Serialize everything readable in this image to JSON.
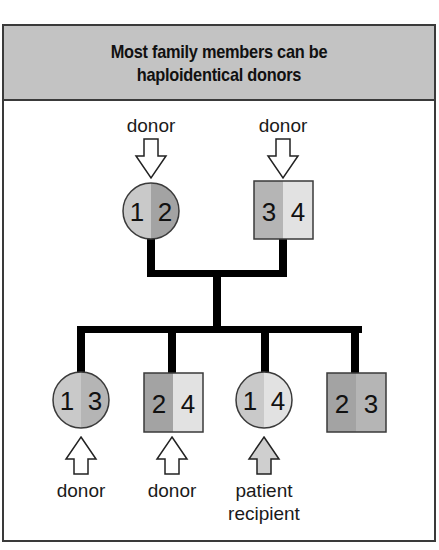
{
  "title": "Most family members can be haploidentical donors",
  "title_lines": [
    "Most family members can be",
    "haploidentical donors"
  ],
  "colors": {
    "haplotype_1": "#c9c9c9",
    "haplotype_2": "#a3a3a3",
    "haplotype_3": "#b5b5b5",
    "haplotype_4": "#e2e2e2",
    "header_bg": "#c3c3c3",
    "line": "#000000",
    "recipient_arrow": "#cfcfcf"
  },
  "parents": [
    {
      "shape": "circle",
      "sex": "female",
      "haplotypes": [
        "1",
        "2"
      ],
      "label": "donor"
    },
    {
      "shape": "square",
      "sex": "male",
      "haplotypes": [
        "3",
        "4"
      ],
      "label": "donor"
    }
  ],
  "children": [
    {
      "shape": "circle",
      "sex": "female",
      "haplotypes": [
        "1",
        "3"
      ],
      "label": "donor"
    },
    {
      "shape": "square",
      "sex": "male",
      "haplotypes": [
        "2",
        "4"
      ],
      "label": "donor"
    },
    {
      "shape": "circle",
      "sex": "female",
      "haplotypes": [
        "1",
        "4"
      ],
      "label_lines": [
        "patient",
        "recipient"
      ]
    },
    {
      "shape": "square",
      "sex": "male",
      "haplotypes": [
        "2",
        "3"
      ],
      "label": ""
    }
  ]
}
